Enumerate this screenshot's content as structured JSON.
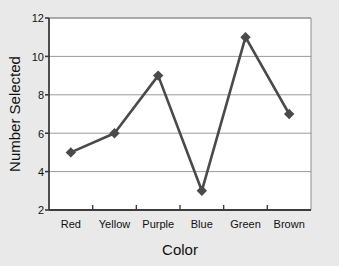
{
  "chart_data": {
    "type": "line",
    "title": "",
    "xlabel": "Color",
    "ylabel": "Number Selected",
    "categories": [
      "Red",
      "Yellow",
      "Purple",
      "Blue",
      "Green",
      "Brown"
    ],
    "values": [
      5,
      6,
      9,
      3,
      11,
      7
    ],
    "yticks": [
      2,
      4,
      6,
      8,
      10,
      12
    ],
    "ylim": [
      2,
      12
    ],
    "grid": "horizontal",
    "legend": "none",
    "marker": "diamond",
    "series_color": "#4a4a4a",
    "plot_background": "#ffffff",
    "page_background": "#e9e9e9",
    "gridline_color": "#9a9a9a",
    "axis_color": "#3c3c3c"
  },
  "axes": {
    "y_tick_0": "2",
    "y_tick_1": "4",
    "y_tick_2": "6",
    "y_tick_3": "8",
    "y_tick_4": "10",
    "y_tick_5": "12",
    "x_cat_0": "Red",
    "x_cat_1": "Yellow",
    "x_cat_2": "Purple",
    "x_cat_3": "Blue",
    "x_cat_4": "Green",
    "x_cat_5": "Brown",
    "y_axis_title": "Number Selected",
    "x_axis_title": "Color"
  }
}
